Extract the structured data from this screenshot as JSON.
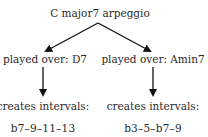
{
  "diagram": {
    "type": "tree",
    "root": {
      "label": "C major7 arpeggio"
    },
    "branches": [
      {
        "context": "played over: D7",
        "result_label": "creates intervals:",
        "intervals": "b7–9–11–13"
      },
      {
        "context": "played over: Amin7",
        "result_label": "creates intervals:",
        "intervals": "b3–5–b7–9"
      }
    ],
    "colors": {
      "text": "#2a2a2a",
      "arrow": "#111111",
      "background": "#ffffff"
    }
  }
}
